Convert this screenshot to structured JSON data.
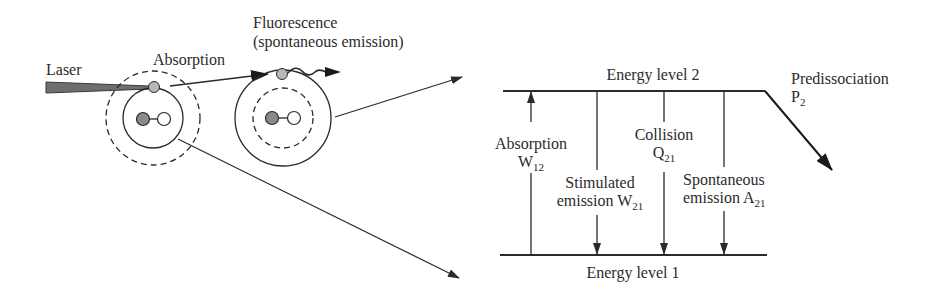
{
  "left_panel": {
    "laser_label": "Laser",
    "absorption_label": "Absorption",
    "fluorescence_label_line1": "Fluorescence",
    "fluorescence_label_line2": "(spontaneous emission)"
  },
  "energy_diagram": {
    "level2_label": "Energy level 2",
    "level1_label": "Energy level 1",
    "processes": [
      {
        "name": "Absorption",
        "symbol": "W",
        "subscript": "12",
        "direction": "up"
      },
      {
        "name": "Stimulated emission",
        "line1": "Stimulated",
        "line2": "emission W",
        "symbol": "W",
        "subscript": "21",
        "direction": "down"
      },
      {
        "name": "Collision",
        "symbol": "Q",
        "subscript": "21",
        "direction": "down"
      },
      {
        "name": "Spontaneous emission",
        "line1": "Spontaneous",
        "line2": "emission A",
        "symbol": "A",
        "subscript": "21",
        "direction": "down"
      },
      {
        "name": "Predissociation",
        "symbol": "P",
        "subscript": "2",
        "direction": "out"
      }
    ]
  },
  "colors": {
    "line": "#2a2a2a",
    "laser_beam": "#6e6e6e",
    "electron": "#b8b8b8",
    "atom_dark": "#8a8a8a",
    "atom_light": "#ffffff"
  }
}
